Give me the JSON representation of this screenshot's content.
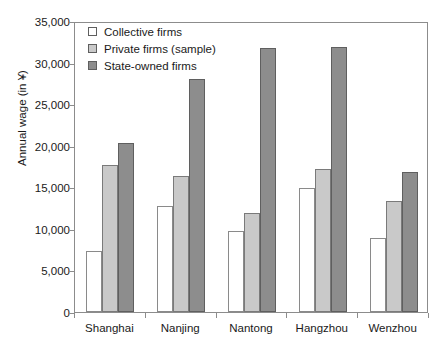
{
  "chart_data": {
    "type": "bar",
    "title": "",
    "xlabel": "",
    "ylabel": "Annual wage (in ¥)",
    "categories": [
      "Shanghai",
      "Nanjing",
      "Nantong",
      "Hangzhou",
      "Wenzhou"
    ],
    "series": [
      {
        "name": "Collective firms",
        "color": "#ffffff",
        "values": [
          7350,
          12800,
          9700,
          14900,
          8900
        ]
      },
      {
        "name": "Private firms (sample)",
        "color": "#c9c9c9",
        "values": [
          17700,
          16400,
          11900,
          17200,
          13400
        ]
      },
      {
        "name": "State-owned firms",
        "color": "#8d8d8d",
        "values": [
          20300,
          28000,
          31700,
          31900,
          16800
        ]
      }
    ],
    "ylim": [
      0,
      35000
    ],
    "ytick_values": [
      0,
      5000,
      10000,
      15000,
      20000,
      25000,
      30000,
      35000
    ],
    "ytick_labels": [
      "0",
      "5,000",
      "10,000",
      "15,000",
      "20,000",
      "25,000",
      "30,000",
      "35,000"
    ],
    "grid": false,
    "legend_position": "top-left"
  }
}
